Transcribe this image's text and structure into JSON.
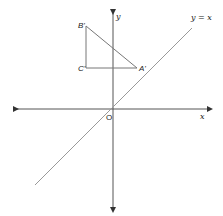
{
  "diagram": {
    "type": "coordinate-plane-reflection",
    "axes": {
      "x_label": "x",
      "y_label": "y",
      "origin_label": "O"
    },
    "line": {
      "label": "y = x"
    },
    "triangle": {
      "vertices": [
        {
          "label": "B'"
        },
        {
          "label": "C'"
        },
        {
          "label": "A'"
        }
      ]
    },
    "colors": {
      "axis": "#444444",
      "line": "#888888",
      "triangle": "#777777"
    }
  }
}
